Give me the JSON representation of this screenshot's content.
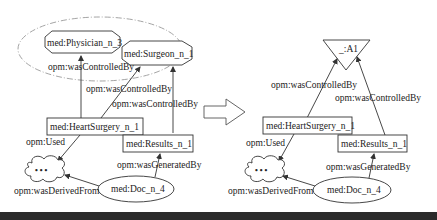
{
  "left_graph": {
    "nodes": {
      "physician": "med:Physician_n_3",
      "surgeon": "med:Surgeon_n_1",
      "heart_surgery": "med:HeartSurgery_n_1",
      "results": "med:Results_n_1",
      "doc": "med:Doc_n_4",
      "cloud": "• • •"
    },
    "edges": {
      "physician_controlled": "opm:wasControlledBy",
      "surgeon_controlled_1": "opm:wasControlledBy",
      "surgeon_controlled_2": "opm:wasControlledBy",
      "used": "opm:Used",
      "generated_by": "opm:wasGeneratedBy",
      "derived_from": "opm:wasDerivedFrom"
    }
  },
  "right_graph": {
    "nodes": {
      "agent": "_:A1",
      "heart_surgery": "med:HeartSurgery_n_1",
      "results": "med:Results_n_1",
      "doc": "med:Doc_n_4",
      "cloud": "• • •"
    },
    "edges": {
      "controlled_1": "opm:wasControlledBy",
      "controlled_2": "opm:wasControlledBy",
      "used": "opm:Used",
      "generated_by": "opm:wasGeneratedBy",
      "derived_from": "opm:wasDerivedFrom"
    }
  },
  "transform_arrow": "right-arrow",
  "colors": {
    "stroke": "#333333",
    "dashed_group": "#9a9a9a",
    "bottom_bar": "#2b2b2b"
  }
}
